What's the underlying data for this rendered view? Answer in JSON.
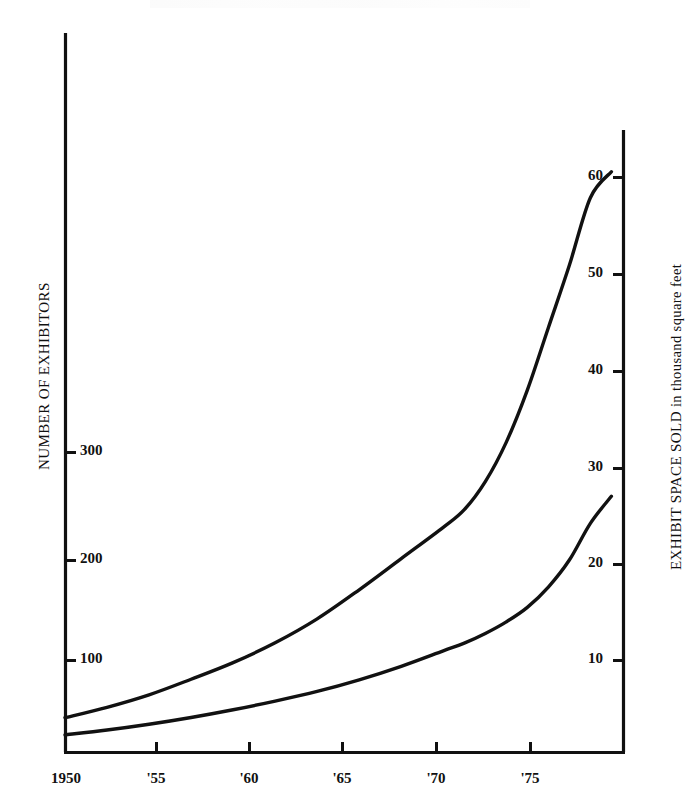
{
  "figure": {
    "background_color": "#ffffff",
    "line_color": "#111111",
    "axis_color": "#111111"
  },
  "left_axis": {
    "title": "NUMBER OF EXHIBITORS",
    "ticks": [
      {
        "label": "100",
        "value": 100
      },
      {
        "label": "200",
        "value": 200
      },
      {
        "label": "300",
        "value": 300
      }
    ]
  },
  "right_axis": {
    "title_part_caps": "EXHIBIT SPACE SOLD",
    "title_part_rest": " in thousand square feet",
    "title": "EXHIBIT SPACE SOLD in thousand square feet",
    "ticks": [
      {
        "label": "10",
        "value": 10
      },
      {
        "label": "20",
        "value": 20
      },
      {
        "label": "30",
        "value": 30
      },
      {
        "label": "40",
        "value": 40
      },
      {
        "label": "50",
        "value": 50
      },
      {
        "label": "60",
        "value": 60
      }
    ]
  },
  "x_axis": {
    "ticks": [
      {
        "label": "1950",
        "value": 1950
      },
      {
        "label": "'55",
        "value": 1955
      },
      {
        "label": "'60",
        "value": 1960
      },
      {
        "label": "'65",
        "value": 1965
      },
      {
        "label": "'70",
        "value": 1970
      },
      {
        "label": "'75",
        "value": 1975
      }
    ]
  },
  "chart_data": {
    "type": "line",
    "title": "",
    "subtitle": "",
    "xlabel": "",
    "ylabel": "NUMBER OF EXHIBITORS",
    "y2label": "EXHIBIT SPACE SOLD in thousand square feet",
    "grid": false,
    "legend": "none",
    "xlim": [
      1950,
      1976.6
    ],
    "ylim": [
      0,
      620
    ],
    "y2lim": [
      0,
      64
    ],
    "x_ticks": [
      1950,
      1955,
      1960,
      1965,
      1970,
      1975
    ],
    "x_tick_labels": [
      "1950",
      "'55",
      "'60",
      "'65",
      "'70",
      "'75"
    ],
    "y_ticks": [
      100,
      200,
      300
    ],
    "y_tick_labels": [
      "100",
      "200",
      "300"
    ],
    "y2_ticks": [
      10,
      20,
      30,
      40,
      50,
      60
    ],
    "y2_tick_labels": [
      "10",
      "20",
      "30",
      "40",
      "50",
      "60"
    ],
    "series": [
      {
        "name": "Number of exhibitors",
        "axis": "left",
        "units": "exhibitors",
        "x": [
          1950,
          1952,
          1954,
          1956,
          1958,
          1960,
          1962,
          1964,
          1966,
          1968,
          1969,
          1970,
          1971,
          1972,
          1973,
          1974,
          1975,
          1976
        ],
        "values": [
          45,
          55,
          67,
          82,
          98,
          117,
          140,
          168,
          198,
          228,
          245,
          272,
          310,
          360,
          420,
          480,
          545,
          570
        ]
      },
      {
        "name": "Exhibit space sold",
        "axis": "right",
        "units": "thousand square feet",
        "x": [
          1950,
          1952,
          1954,
          1956,
          1958,
          1960,
          1962,
          1964,
          1966,
          1968,
          1969,
          1970,
          1971,
          1972,
          1973,
          1974,
          1975,
          1976
        ],
        "values": [
          2.3,
          2.8,
          3.4,
          4.1,
          4.9,
          5.8,
          6.8,
          8.0,
          9.4,
          11.0,
          11.8,
          12.8,
          14.0,
          15.5,
          17.6,
          20.4,
          24.2,
          27.0
        ]
      }
    ]
  },
  "geometry": {
    "plot_left": 65,
    "plot_right": 624,
    "plot_bottom": 752,
    "left_axis_top": 33,
    "right_axis_top": 130,
    "exhibitors_curve_path": "M67,705 C110,693 150,679 190,662 C232,644 270,624 308,598 C345,573 380,542 410,508 C435,479 455,446 473,409 C490,373 505,330 518,287 C530,247 540,202 550,160",
    "space_curve_path": "M67,731 C110,724 150,716 190,706 C232,695 270,682 308,665 C345,648 380,628 410,604 C435,583 455,560 473,552 C480,548 487,542 494,534 C505,522 518,512 530,502 C538,497 545,494 551,493"
  }
}
